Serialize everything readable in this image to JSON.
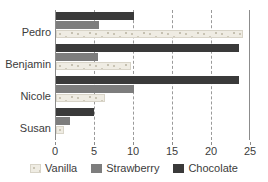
{
  "chart_data": {
    "type": "bar",
    "orientation": "horizontal",
    "title": "",
    "xlabel": "",
    "ylabel": "",
    "categories": [
      "Pedro",
      "Benjamin",
      "Nicole",
      "Susan"
    ],
    "series": [
      {
        "name": "Vanilla",
        "color": "#efece3",
        "values": [
          24.0,
          9.6,
          6.3,
          1.0
        ]
      },
      {
        "name": "Strawberry",
        "color": "#7d7d7d",
        "values": [
          5.5,
          5.4,
          10.0,
          1.8
        ]
      },
      {
        "name": "Chocolate",
        "color": "#3a3a3a",
        "values": [
          10.0,
          23.5,
          23.5,
          4.9
        ]
      }
    ],
    "series_draw_order": [
      "Chocolate",
      "Strawberry",
      "Vanilla"
    ],
    "xlim": [
      0,
      25
    ],
    "xticks": [
      0,
      5,
      10,
      15,
      20,
      25
    ],
    "xticklabels": [
      "0",
      "5",
      "10",
      "15",
      "20",
      "25"
    ],
    "gridlines_x": [
      5,
      10,
      15,
      20
    ],
    "grid": true,
    "legend_position": "bottom"
  },
  "axis": {
    "tick_0": "0",
    "tick_5": "5",
    "tick_10": "10",
    "tick_15": "15",
    "tick_20": "20",
    "tick_25": "25"
  },
  "categories": {
    "pedro": "Pedro",
    "benjamin": "Benjamin",
    "nicole": "Nicole",
    "susan": "Susan"
  },
  "legend": {
    "vanilla": "Vanilla",
    "strawberry": "Strawberry",
    "chocolate": "Chocolate"
  }
}
